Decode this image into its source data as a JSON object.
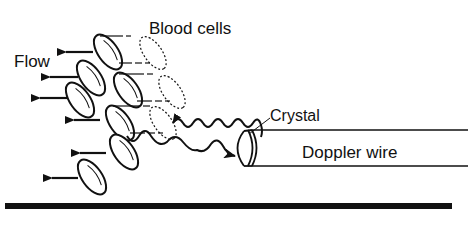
{
  "diagram": {
    "type": "schematic",
    "labels": {
      "blood_cells": "Blood cells",
      "flow": "Flow",
      "crystal": "Crystal",
      "doppler_wire": "Doppler wire"
    },
    "components": [
      {
        "id": "blood-cells",
        "kind": "ellipses",
        "count_solid": 7,
        "count_dashed_previous_position": 3
      },
      {
        "id": "flow-arrows",
        "kind": "arrows",
        "direction": "left",
        "count": 7
      },
      {
        "id": "ultrasound-waves",
        "kind": "wavy-lines",
        "count": 2,
        "note": "emitted wave and reflected wave with arrowheads"
      },
      {
        "id": "crystal",
        "kind": "transducer-cap",
        "position": "tip of wire"
      },
      {
        "id": "doppler-wire",
        "kind": "cylinder",
        "orientation": "horizontal"
      },
      {
        "id": "vessel-wall",
        "kind": "thick-line",
        "position": "bottom"
      }
    ],
    "colors": {
      "stroke": "#111111",
      "background": "#ffffff"
    }
  }
}
